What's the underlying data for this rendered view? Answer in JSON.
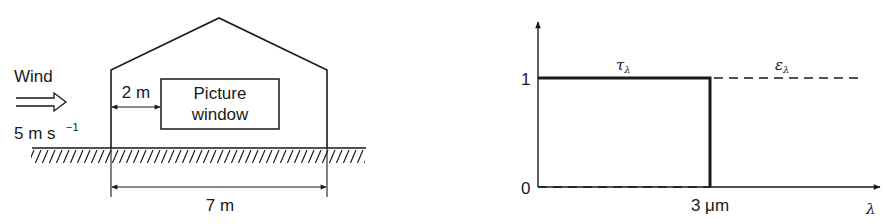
{
  "left_diagram": {
    "wind_label": "Wind",
    "wind_speed": "5 m s",
    "wind_speed_exponent": "−1",
    "distance_label": "2 m",
    "window_label_line1": "Picture",
    "window_label_line2": "window",
    "width_label": "7 m"
  },
  "right_diagram": {
    "y_tick_1": "1",
    "y_tick_0": "0",
    "x_tick": "3 μm",
    "x_axis_symbol": "λ",
    "tau_label": "τ",
    "tau_subscript": "λ",
    "epsilon_label": "ε",
    "epsilon_subscript": "λ"
  },
  "chart_data": {
    "type": "line",
    "title": "",
    "xlabel": "λ",
    "ylabel": "",
    "x_ticks": [
      "3 μm"
    ],
    "y_ticks": [
      "0",
      "1"
    ],
    "ylim": [
      0,
      1
    ],
    "series": [
      {
        "name": "τλ",
        "style": "solid",
        "points": [
          [
            0,
            1
          ],
          [
            3,
            1
          ],
          [
            3,
            0
          ]
        ]
      },
      {
        "name": "ελ",
        "style": "dashed",
        "points": [
          [
            0,
            0
          ],
          [
            3,
            0
          ],
          [
            3,
            1
          ],
          [
            6,
            1
          ]
        ]
      }
    ]
  }
}
